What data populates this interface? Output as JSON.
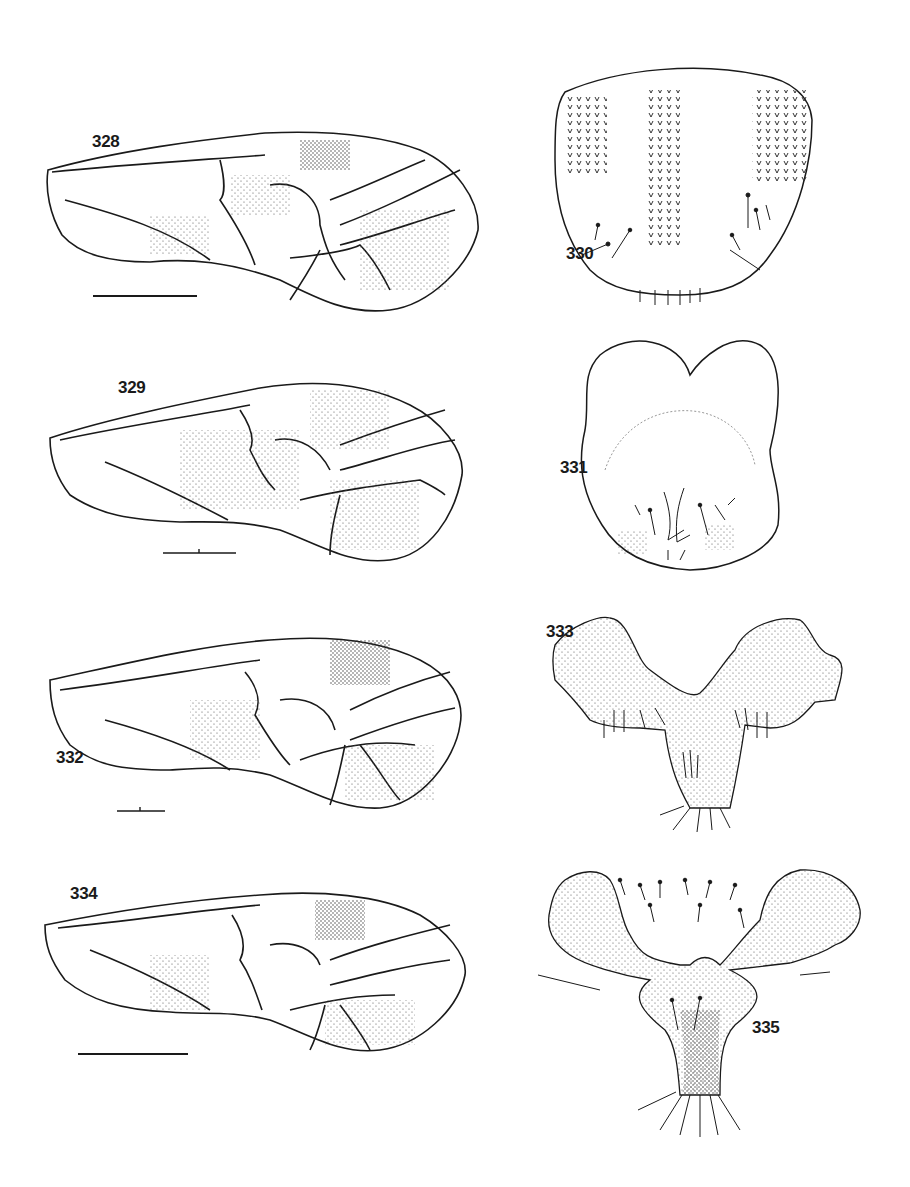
{
  "plate": {
    "background": "#ffffff",
    "ink": "#1a1a1a",
    "figures": [
      {
        "number": "328",
        "subject": "forewing",
        "label": "328"
      },
      {
        "number": "329",
        "subject": "forewing",
        "label": "329"
      },
      {
        "number": "330",
        "subject": "sclerite-plate",
        "label": "330"
      },
      {
        "number": "331",
        "subject": "sclerite-plate",
        "label": "331"
      },
      {
        "number": "332",
        "subject": "forewing",
        "label": "332"
      },
      {
        "number": "333",
        "subject": "genital-plate",
        "label": "333"
      },
      {
        "number": "334",
        "subject": "forewing",
        "label": "334"
      },
      {
        "number": "335",
        "subject": "genital-plate",
        "label": "335"
      }
    ],
    "scale_bars": [
      "328",
      "329",
      "332",
      "334"
    ]
  }
}
